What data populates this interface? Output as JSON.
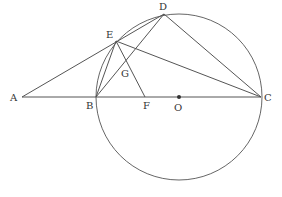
{
  "figure": {
    "type": "geometry",
    "points": {
      "A": {
        "label": "A",
        "x": 22,
        "y": 97
      },
      "B": {
        "label": "B",
        "x": 96,
        "y": 97
      },
      "C": {
        "label": "C",
        "x": 261,
        "y": 97
      },
      "D": {
        "label": "D",
        "x": 164,
        "y": 14
      },
      "E": {
        "label": "E",
        "x": 116,
        "y": 41
      },
      "F": {
        "label": "F",
        "x": 145,
        "y": 97
      },
      "G": {
        "label": "G",
        "x": 127,
        "y": 73
      },
      "O": {
        "label": "O",
        "x": 179,
        "y": 97
      }
    },
    "circle": {
      "center": "O",
      "r": 83
    },
    "segments": [
      "A-C",
      "A-D",
      "E-C",
      "D-C",
      "B-D",
      "B-E",
      "E-F"
    ]
  }
}
